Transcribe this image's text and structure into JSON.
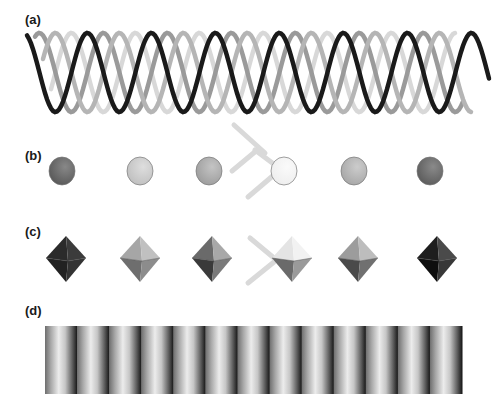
{
  "figure": {
    "panels": [
      {
        "label": "(a)",
        "content": "helix",
        "description": "Four overlapping helical strands in black, mid-gray, light gray and gray"
      },
      {
        "label": "(b)",
        "content": "spheres",
        "description": "Row of six shaded spheres"
      },
      {
        "label": "(c)",
        "content": "octahedra",
        "description": "Row of six shaded octahedra"
      },
      {
        "label": "(d)",
        "content": "stripes",
        "description": "Periodic vertical gradient stripe band"
      }
    ],
    "helix": {
      "strands": [
        {
          "color": "#d8d8d8",
          "phase": 48
        },
        {
          "color": "#9a9a9a",
          "phase": 16
        },
        {
          "color": "#b5b5b5",
          "phase": 32
        },
        {
          "color": "#1a1a1a",
          "phase": 0
        }
      ],
      "x_start": 27,
      "x_end": 490,
      "period": 64,
      "y_top": 33,
      "y_bottom": 112
    },
    "spheres": [
      {
        "cx": 62,
        "fill": "#555555",
        "hi": "#888888"
      },
      {
        "cx": 140,
        "fill": "#bdbdbd",
        "hi": "#dedede"
      },
      {
        "cx": 209,
        "fill": "#9a9a9a",
        "hi": "#c4c4c4"
      },
      {
        "cx": 284,
        "fill": "#ededed",
        "hi": "#fafafa"
      },
      {
        "cx": 354,
        "fill": "#a4a4a4",
        "hi": "#cccccc"
      },
      {
        "cx": 430,
        "fill": "#585858",
        "hi": "#8a8a8a"
      }
    ],
    "octahedra": [
      {
        "cx": 66,
        "tl": "#2b2b2b",
        "tr": "#3b3b3b",
        "bl": "#222222",
        "br": "#333333"
      },
      {
        "cx": 140,
        "tl": "#a6a6a6",
        "tr": "#c0c0c0",
        "bl": "#6e6e6e",
        "br": "#8c8c8c"
      },
      {
        "cx": 212,
        "tl": "#6a6a6a",
        "tr": "#a8a8a8",
        "bl": "#3a3a3a",
        "br": "#7a7a7a"
      },
      {
        "cx": 292,
        "tl": "#e4e4e4",
        "tr": "#f2f2f2",
        "bl": "#6a6a6a",
        "br": "#9a9a9a"
      },
      {
        "cx": 358,
        "tl": "#9c9c9c",
        "tr": "#bdbdbd",
        "bl": "#4a4a4a",
        "br": "#707070"
      },
      {
        "cx": 437,
        "tl": "#1e1e1e",
        "tr": "#4a4a4a",
        "bl": "#0e0e0e",
        "br": "#383838"
      }
    ],
    "stripes": {
      "x": 45,
      "y": 326,
      "width": 417,
      "height": 68,
      "count": 13
    }
  }
}
